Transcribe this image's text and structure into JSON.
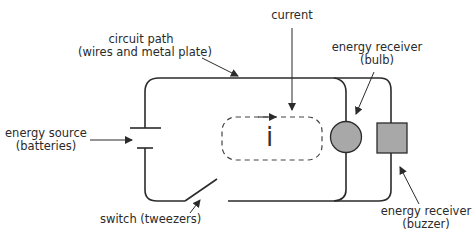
{
  "diagram": {
    "type": "circuit-diagram",
    "labels": {
      "circuit_path": {
        "line1": "circuit path",
        "line2": "(wires and metal plate)"
      },
      "current": {
        "line1": "current"
      },
      "energy_receiver_bulb": {
        "line1": "energy receiver",
        "line2": "(bulb)"
      },
      "energy_source": {
        "line1": "energy source",
        "line2": "(batteries)"
      },
      "switch": {
        "line1": "switch (tweezers)"
      },
      "energy_receiver_buzzer": {
        "line1": "energy receiver",
        "line2": "(buzzer)"
      },
      "current_symbol": "i"
    },
    "components": [
      {
        "name": "battery",
        "role": "energy source"
      },
      {
        "name": "switch",
        "role": "switch (tweezers)",
        "state": "open"
      },
      {
        "name": "bulb",
        "role": "energy receiver",
        "shape": "circle"
      },
      {
        "name": "buzzer",
        "role": "energy receiver",
        "shape": "square"
      },
      {
        "name": "current-loop",
        "role": "current",
        "style": "dashed"
      }
    ],
    "colors": {
      "wire": "#2b2b2b",
      "component_fill": "#a8a8a8",
      "text": "#2a2a2a",
      "background": "#ffffff"
    }
  }
}
